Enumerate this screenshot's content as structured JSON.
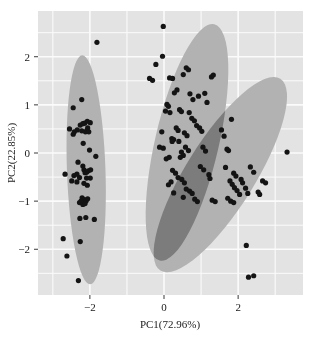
{
  "chart_data": {
    "type": "scatter",
    "title": "",
    "xlabel": "PC1(72.96%)",
    "ylabel": "PC2(22.85%)",
    "xlim": [
      -3.4,
      3.75
    ],
    "ylim": [
      -2.95,
      2.95
    ],
    "xticks": [
      -2,
      0,
      2
    ],
    "xtick_labels": [
      "−2",
      "0",
      "2"
    ],
    "yticks": [
      -2,
      -1,
      0,
      1,
      2
    ],
    "ytick_labels": [
      "−2",
      "−1",
      "0",
      "1",
      "2"
    ],
    "grid": true,
    "grid_color": "#fbfbfb",
    "plot_background": "#e3e3e3",
    "figure_background": "#ffffff",
    "point_color": "#141414",
    "point_size": 2.6,
    "legend": "none",
    "confidence_ellipses": [
      {
        "name": "group-1-ellipse",
        "color": "#b2b2b2",
        "opacity": 1,
        "cx": -2.1,
        "cy": -0.35,
        "rx": 0.52,
        "ry": 2.38,
        "rotation": -2
      },
      {
        "name": "group-2-ellipse",
        "color": "#b2b2b2",
        "opacity": 1,
        "cx": 0.62,
        "cy": 0.22,
        "rx": 0.86,
        "ry": 2.52,
        "rotation": 13
      },
      {
        "name": "group-3-ellipse",
        "color": "#b2b2b2",
        "opacity": 1,
        "cx": 1.52,
        "cy": -0.45,
        "rx": 0.93,
        "ry": 2.35,
        "rotation": 32
      }
    ],
    "series": [
      {
        "name": "group-1",
        "points": [
          [
            -2.67,
            -0.44
          ],
          [
            -2.45,
            0.94
          ],
          [
            -2.22,
            1.11
          ],
          [
            -2.07,
            0.66
          ],
          [
            -2.14,
            0.62
          ],
          [
            -1.99,
            0.63
          ],
          [
            -2.34,
            0.48
          ],
          [
            -2.22,
            0.46
          ],
          [
            -2.12,
            0.44
          ],
          [
            -2.08,
            0.47
          ],
          [
            -2.03,
            0.44
          ],
          [
            -2.45,
            0.39
          ],
          [
            -2.18,
            0.2
          ],
          [
            -2.01,
            0.06
          ],
          [
            -1.84,
            -0.07
          ],
          [
            -2.32,
            -0.19
          ],
          [
            -2.19,
            -0.27
          ],
          [
            -2.16,
            -0.35
          ],
          [
            -2.13,
            -0.41
          ],
          [
            -2.09,
            -0.4
          ],
          [
            -2.04,
            -0.37
          ],
          [
            -1.98,
            -0.35
          ],
          [
            -2.43,
            -0.47
          ],
          [
            -2.28,
            -0.51
          ],
          [
            -2.35,
            -0.6
          ],
          [
            -2.16,
            -0.63
          ],
          [
            -2.21,
            -0.93
          ],
          [
            -2.15,
            -0.97
          ],
          [
            -2.1,
            -0.99
          ],
          [
            -2.06,
            -0.95
          ],
          [
            -2.28,
            -1.03
          ],
          [
            -2.19,
            -1.07
          ],
          [
            -2.27,
            -1.36
          ],
          [
            -2.11,
            -1.34
          ],
          [
            -1.88,
            -1.38
          ],
          [
            -2.72,
            -1.78
          ],
          [
            -2.26,
            -1.84
          ],
          [
            -2.62,
            -2.14
          ],
          [
            -2.31,
            -2.65
          ],
          [
            -1.81,
            2.3
          ],
          [
            -2.55,
            0.5
          ],
          [
            -2.42,
            0.44
          ],
          [
            -2.26,
            0.58
          ],
          [
            -2.19,
            0.61
          ],
          [
            -2.06,
            0.52
          ],
          [
            -2.49,
            -0.58
          ],
          [
            -2.35,
            -0.44
          ],
          [
            -2.07,
            -0.67
          ],
          [
            -1.99,
            -0.52
          ],
          [
            -2.24,
            -1.0
          ],
          [
            -2.13,
            -1.05
          ],
          [
            -2.09,
            -0.52
          ]
        ]
      },
      {
        "name": "group-2",
        "points": [
          [
            -0.02,
            2.63
          ],
          [
            -0.04,
            2.01
          ],
          [
            -0.22,
            1.84
          ],
          [
            -0.39,
            1.55
          ],
          [
            -0.31,
            1.51
          ],
          [
            0.15,
            1.56
          ],
          [
            0.23,
            1.55
          ],
          [
            0.6,
            1.77
          ],
          [
            0.66,
            1.73
          ],
          [
            0.52,
            1.63
          ],
          [
            0.35,
            1.31
          ],
          [
            0.28,
            1.25
          ],
          [
            0.08,
            1.01
          ],
          [
            0.12,
            0.97
          ],
          [
            0.04,
            0.87
          ],
          [
            0.16,
            0.84
          ],
          [
            0.42,
            0.9
          ],
          [
            0.47,
            0.86
          ],
          [
            0.33,
            0.52
          ],
          [
            0.38,
            0.47
          ],
          [
            0.21,
            0.3
          ],
          [
            0.26,
            0.28
          ],
          [
            0.22,
            0.24
          ],
          [
            0.4,
            0.24
          ],
          [
            0.55,
            0.42
          ],
          [
            0.62,
            0.36
          ],
          [
            0.58,
            0.12
          ],
          [
            0.66,
            0.05
          ],
          [
            0.47,
            0.02
          ],
          [
            0.52,
            -0.05
          ],
          [
            0.44,
            -0.09
          ],
          [
            -0.06,
            0.44
          ],
          [
            -0.12,
            0.12
          ],
          [
            -0.02,
            0.1
          ],
          [
            0.06,
            -0.12
          ],
          [
            0.14,
            -0.09
          ],
          [
            0.23,
            -0.36
          ],
          [
            0.31,
            -0.42
          ],
          [
            0.38,
            -0.51
          ],
          [
            0.48,
            -0.55
          ],
          [
            0.55,
            -0.62
          ],
          [
            0.19,
            -0.6
          ],
          [
            0.12,
            -0.66
          ],
          [
            0.6,
            -0.75
          ],
          [
            0.69,
            -0.79
          ],
          [
            0.52,
            -0.92
          ],
          [
            0.76,
            -0.84
          ],
          [
            0.83,
            -0.96
          ],
          [
            0.9,
            -1.01
          ],
          [
            0.26,
            -0.83
          ],
          [
            0.88,
            0.57
          ],
          [
            0.96,
            0.52
          ],
          [
            1.02,
            0.45
          ],
          [
            0.82,
            0.67
          ],
          [
            0.75,
            0.72
          ],
          [
            1.1,
            1.24
          ],
          [
            1.16,
            1.05
          ],
          [
            1.28,
            1.58
          ],
          [
            1.33,
            1.62
          ],
          [
            0.93,
            1.18
          ],
          [
            0.78,
            1.11
          ],
          [
            0.7,
            1.23
          ],
          [
            0.68,
            0.84
          ],
          [
            1.05,
            0.12
          ],
          [
            1.12,
            0.04
          ],
          [
            0.98,
            -0.28
          ],
          [
            1.07,
            -0.35
          ],
          [
            1.21,
            -0.45
          ],
          [
            1.24,
            -0.53
          ],
          [
            1.3,
            -0.98
          ],
          [
            1.38,
            -1.01
          ]
        ]
      },
      {
        "name": "group-3",
        "points": [
          [
            1.55,
            0.48
          ],
          [
            1.62,
            0.35
          ],
          [
            1.7,
            0.08
          ],
          [
            1.74,
            0.05
          ],
          [
            1.82,
            0.7
          ],
          [
            1.88,
            -0.42
          ],
          [
            1.94,
            -0.48
          ],
          [
            1.78,
            -0.58
          ],
          [
            1.84,
            -0.65
          ],
          [
            1.9,
            -0.72
          ],
          [
            1.97,
            -0.78
          ],
          [
            2.04,
            -0.86
          ],
          [
            1.72,
            -0.94
          ],
          [
            1.8,
            -1.0
          ],
          [
            1.88,
            -1.03
          ],
          [
            2.12,
            -0.62
          ],
          [
            2.2,
            -0.73
          ],
          [
            2.26,
            -0.84
          ],
          [
            2.33,
            -0.29
          ],
          [
            2.42,
            -0.4
          ],
          [
            2.54,
            -0.81
          ],
          [
            2.58,
            -0.86
          ],
          [
            2.66,
            -0.58
          ],
          [
            2.74,
            -0.62
          ],
          [
            3.32,
            0.02
          ],
          [
            2.22,
            -1.92
          ],
          [
            2.28,
            -2.58
          ],
          [
            2.42,
            -2.55
          ],
          [
            2.08,
            -0.55
          ],
          [
            1.66,
            -0.3
          ]
        ]
      }
    ]
  },
  "axes": {
    "x_title": "PC1(72.96%)",
    "y_title": "PC2(22.85%)"
  }
}
